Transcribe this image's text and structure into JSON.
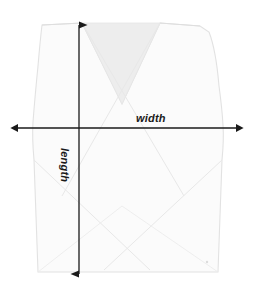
{
  "diagram": {
    "labels": {
      "width": "width",
      "length": "length"
    },
    "icons": {
      "width_arrow": "double-headed-horizontal-arrow-icon",
      "length_arrow": "double-headed-vertical-arrow-icon"
    },
    "colors": {
      "background": "#ffffff",
      "garment_fill": "#fbfbfb",
      "neck_fill": "#ededed",
      "outline": "#e2e2e2",
      "crease": "#e8e8e8",
      "arrow": "#1a1a1a",
      "label_text": "#1a1a1a"
    },
    "measure_lines": {
      "width": {
        "orientation": "horizontal",
        "x_start": 18,
        "x_end": 236,
        "y": 128
      },
      "length": {
        "orientation": "vertical",
        "y_start": 25,
        "y_end": 274,
        "x": 79
      }
    }
  }
}
